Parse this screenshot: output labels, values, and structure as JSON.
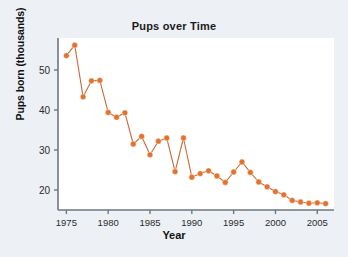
{
  "chart_data": {
    "type": "line",
    "title": "Pups over Time",
    "xlabel": "Year",
    "ylabel": "Pups born (thousands)",
    "xlim": [
      1974,
      2007
    ],
    "ylim": [
      15,
      58
    ],
    "grid": false,
    "legend": null,
    "marker": "circle",
    "series_color": "#E2722E",
    "line_color": "#C96A38",
    "x": [
      1975,
      1976,
      1977,
      1978,
      1979,
      1980,
      1981,
      1982,
      1983,
      1984,
      1985,
      1986,
      1987,
      1988,
      1989,
      1990,
      1991,
      1992,
      1993,
      1994,
      1995,
      1996,
      1997,
      1998,
      1999,
      2000,
      2001,
      2002,
      2003,
      2004,
      2005,
      2006
    ],
    "values": [
      53.6,
      56.2,
      43.3,
      47.3,
      47.4,
      39.4,
      38.2,
      39.3,
      31.5,
      33.4,
      28.8,
      32.2,
      33.0,
      24.6,
      33.0,
      23.2,
      24.1,
      24.8,
      23.5,
      21.9,
      24.5,
      27.0,
      24.4,
      22.0,
      20.8,
      19.6,
      18.8,
      17.4,
      17.0,
      16.7,
      16.8,
      16.6
    ],
    "xticks": [
      1975,
      1980,
      1985,
      1990,
      1995,
      2000,
      2005
    ],
    "xtick_labels": [
      "1975",
      "1980",
      "1985",
      "1990",
      "1995",
      "2000",
      "2005"
    ],
    "yticks": [
      20,
      30,
      40,
      50
    ],
    "ytick_labels": [
      "20",
      "30",
      "40",
      "50"
    ]
  },
  "figure": {
    "background_color": "#edf1f5",
    "plot_background_color": "#ffffff",
    "axis_color": "#6b7780"
  }
}
